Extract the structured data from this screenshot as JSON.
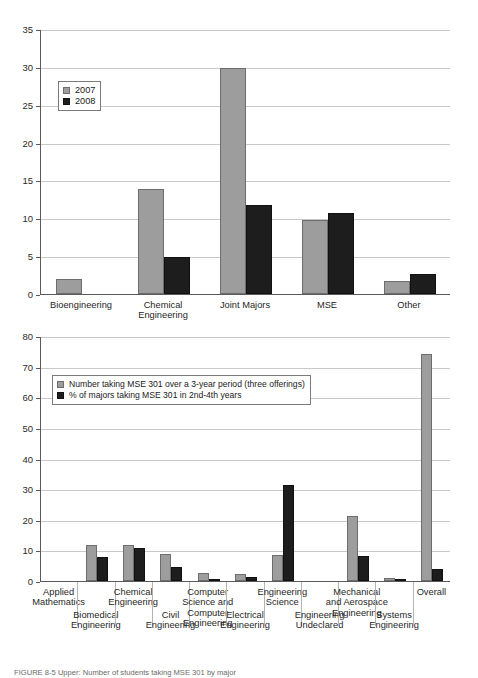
{
  "figure": {
    "caption": "FIGURE 8-5  Upper: Number of students taking MSE 301 by major"
  },
  "chart_data": [
    {
      "id": "top",
      "type": "bar",
      "title": "",
      "xlabel": "",
      "ylabel": "",
      "ylim": [
        0,
        35
      ],
      "yticks": [
        0,
        5,
        10,
        15,
        20,
        25,
        30,
        35
      ],
      "grid": true,
      "legend_position": "upper-left",
      "categories": [
        "Bioengineering",
        "Chemical\nEngineering",
        "Joint Majors",
        "MSE",
        "Other"
      ],
      "series": [
        {
          "name": "2007",
          "color": "#9d9d9d",
          "values": [
            2.0,
            13.9,
            29.9,
            9.8,
            1.7
          ]
        },
        {
          "name": "2008",
          "color": "#1d1d1d",
          "values": [
            0,
            4.9,
            11.8,
            10.7,
            2.6
          ]
        }
      ]
    },
    {
      "id": "bottom",
      "type": "bar",
      "title": "",
      "xlabel": "",
      "ylabel": "",
      "ylim": [
        0,
        80
      ],
      "yticks": [
        0,
        10,
        20,
        30,
        40,
        50,
        60,
        70,
        80
      ],
      "grid": true,
      "legend_position": "upper-left",
      "categories": [
        "Applied\nMathematics",
        "Biomedical\nEngineering",
        "Chemical\nEngineering",
        "Civil\nEngineering",
        "Computer\nScience and\nComputer\nEngineering",
        "Electrical\nEngineering",
        "Engineering\nScience",
        "Engineering\nUndeclared",
        "Mechanical\nand Aerospace\nEngineering",
        "Systems\nEngineering",
        "Overall"
      ],
      "series": [
        {
          "name": "Number taking MSE 301 over a 3-year period (three offerings)",
          "color": "#9d9d9d",
          "values": [
            0,
            11.9,
            11.8,
            8.7,
            2.5,
            2.4,
            8.4,
            0,
            21.2,
            1.1,
            74.0
          ]
        },
        {
          "name": "% of majors taking MSE 301 in 2nd-4th years",
          "color": "#1d1d1d",
          "values": [
            0,
            7.9,
            10.7,
            4.6,
            0.6,
            1.4,
            31.4,
            0,
            8.2,
            0.3,
            4.0
          ]
        }
      ]
    }
  ]
}
